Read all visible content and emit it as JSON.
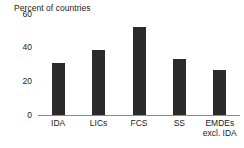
{
  "chart_data": {
    "type": "bar",
    "title": "Percent of countries",
    "xlabel": "",
    "ylabel": "",
    "categories": [
      "IDA",
      "LICs",
      "FCS",
      "SS",
      "EMDEs\nexcl. IDA"
    ],
    "values": [
      31,
      38.5,
      52,
      33.5,
      27
    ],
    "ylim": [
      0,
      60
    ],
    "yticks": [
      0,
      20,
      40,
      60
    ],
    "ytick_labels": [
      "0",
      "20",
      "40",
      "60"
    ],
    "grid": false,
    "legend": null,
    "bar_color": "#2b2b2b",
    "axis_color": "#8c8c8c",
    "text_color": "#1a1a1a"
  }
}
